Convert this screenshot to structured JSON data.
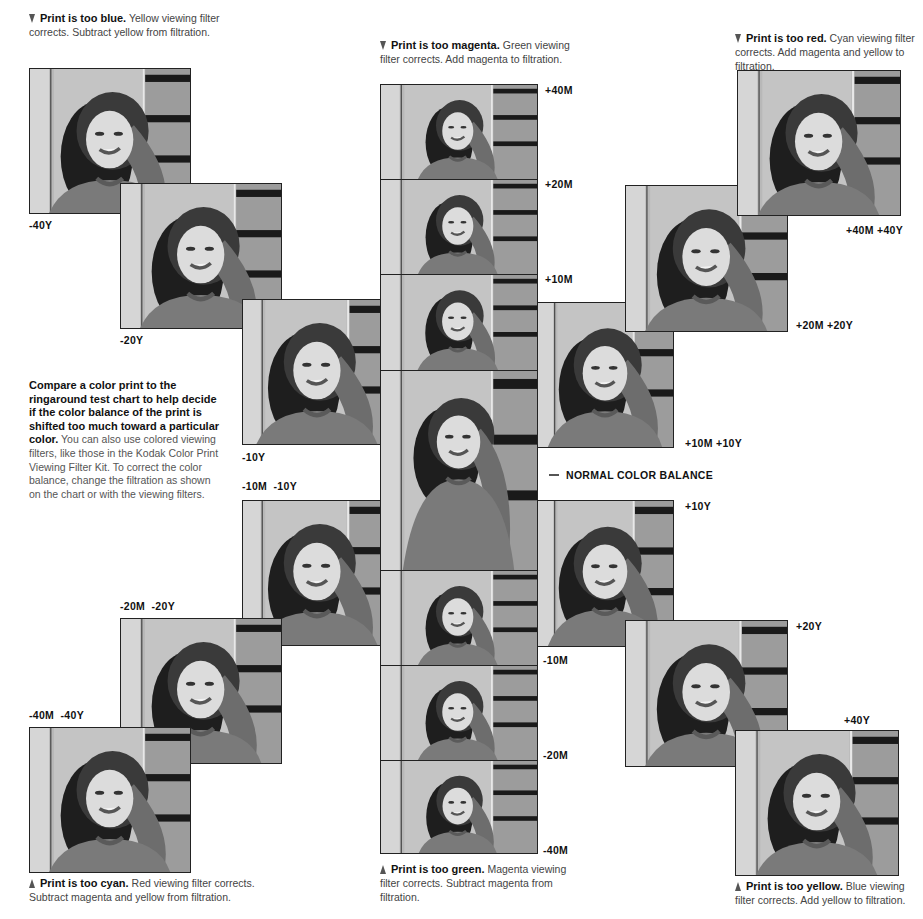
{
  "captions": {
    "too_blue": {
      "bold": "Print is too blue.",
      "text": " Yellow viewing filter corrects. Subtract yellow from filtration.",
      "icon": "arrow-down-icon"
    },
    "too_magenta": {
      "bold": "Print is too magenta.",
      "text": " Green viewing filter corrects. Add magenta to filtration.",
      "icon": "arrow-down-icon"
    },
    "too_red": {
      "bold": "Print is too red.",
      "text": " Cyan viewing filter corrects. Add magenta and yellow to filtration.",
      "icon": "arrow-down-icon"
    },
    "too_cyan": {
      "bold": "Print is too cyan.",
      "text": " Red viewing filter corrects. Subtract magenta and yellow from filtration.",
      "icon": "arrow-up-icon"
    },
    "too_green": {
      "bold": "Print is too green.",
      "text": " Magenta viewing filter corrects. Subtract magenta from filtration.",
      "icon": "arrow-up-icon"
    },
    "too_yellow": {
      "bold": "Print is too yellow.",
      "text": " Blue viewing filter corrects. Add yellow to filtration.",
      "icon": "arrow-up-icon"
    }
  },
  "intro": {
    "bold": "Compare a color print to the ringaround test chart to help decide if the color balance of the print is shifted too much toward a particular color.",
    "text": " You can also use colored viewing filters, like those in the Kodak Color Print Viewing Filter Kit. To correct the color balance, change the filtration as shown on the chart or with the viewing filters."
  },
  "labels": {
    "m40y": "-40Y",
    "m20y": "-20Y",
    "m10y": "-10Y",
    "m10m_m10y": "-10M  -10Y",
    "m20m_m20y": "-20M  -20Y",
    "m40m_m40y": "-40M  -40Y",
    "p40m": "+40M",
    "p20m": "+20M",
    "p10m": "+10M",
    "normal": "NORMAL COLOR BALANCE",
    "m10m": "-10M",
    "m20m": "-20M",
    "m40m": "-40M",
    "p10m_p10y": "+10M +10Y",
    "p20m_p20y": "+20M +20Y",
    "p40m_p40y": "+40M +40Y",
    "p10y": "+10Y",
    "p20y": "+20Y",
    "p40y": "+40Y"
  },
  "photos": [
    {
      "id": "m40y",
      "filtration": "-40Y",
      "x": 29,
      "y": 68,
      "w": 162,
      "h": 146
    },
    {
      "id": "m20y",
      "filtration": "-20Y",
      "x": 120,
      "y": 183,
      "w": 162,
      "h": 146
    },
    {
      "id": "m10y",
      "filtration": "-10Y",
      "x": 242,
      "y": 299,
      "w": 150,
      "h": 146
    },
    {
      "id": "m10m_m10y",
      "filtration": "-10M -10Y",
      "x": 242,
      "y": 500,
      "w": 150,
      "h": 146
    },
    {
      "id": "m20m_m20y",
      "filtration": "-20M -20Y",
      "x": 120,
      "y": 618,
      "w": 162,
      "h": 146
    },
    {
      "id": "m40m_m40y",
      "filtration": "-40M -40Y",
      "x": 29,
      "y": 727,
      "w": 162,
      "h": 146
    },
    {
      "id": "p10m_p10y",
      "filtration": "+10M +10Y",
      "x": 536,
      "y": 302,
      "w": 138,
      "h": 146
    },
    {
      "id": "p20m_p20y",
      "filtration": "+20M +20Y",
      "x": 625,
      "y": 185,
      "w": 163,
      "h": 147
    },
    {
      "id": "p40m_p40y",
      "filtration": "+40M +40Y",
      "x": 737,
      "y": 70,
      "w": 164,
      "h": 146
    },
    {
      "id": "p10y",
      "filtration": "+10Y",
      "x": 536,
      "y": 500,
      "w": 138,
      "h": 147
    },
    {
      "id": "p20y",
      "filtration": "+20Y",
      "x": 625,
      "y": 620,
      "w": 163,
      "h": 147
    },
    {
      "id": "p40y",
      "filtration": "+40Y",
      "x": 735,
      "y": 730,
      "w": 164,
      "h": 146
    },
    {
      "id": "p40m",
      "filtration": "+40M",
      "x": 380,
      "y": 84,
      "w": 158,
      "h": 96
    },
    {
      "id": "p20m",
      "filtration": "+20M",
      "x": 380,
      "y": 179,
      "w": 158,
      "h": 96
    },
    {
      "id": "p10m",
      "filtration": "+10M",
      "x": 380,
      "y": 274,
      "w": 158,
      "h": 97
    },
    {
      "id": "normal",
      "filtration": "Normal",
      "x": 380,
      "y": 370,
      "w": 158,
      "h": 201
    },
    {
      "id": "m10m",
      "filtration": "-10M",
      "x": 380,
      "y": 570,
      "w": 158,
      "h": 96
    },
    {
      "id": "m20m",
      "filtration": "-20M",
      "x": 380,
      "y": 665,
      "w": 158,
      "h": 96
    },
    {
      "id": "m40m",
      "filtration": "-40M",
      "x": 380,
      "y": 760,
      "w": 158,
      "h": 94
    }
  ]
}
